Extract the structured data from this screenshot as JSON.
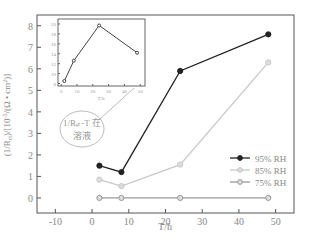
{
  "chart_data": {
    "type": "line",
    "title": "",
    "xlabel": "T/h",
    "ylabel": "(1/R_ct)/[10^-5/(Ω·cm²)]",
    "xlim": [
      -15,
      55
    ],
    "ylim": [
      -0.7,
      8.5
    ],
    "xticks": [
      -10,
      0,
      10,
      20,
      30,
      40,
      50
    ],
    "yticks": [
      0,
      1,
      2,
      3,
      4,
      5,
      6,
      7,
      8
    ],
    "x": [
      2,
      8,
      24,
      48
    ],
    "series": [
      {
        "name": "95% RH",
        "values": [
          1.5,
          1.2,
          5.9,
          7.6
        ],
        "color": "#222222"
      },
      {
        "name": "85% RH",
        "values": [
          0.85,
          0.55,
          1.55,
          6.3
        ],
        "color": "#c8c8c8"
      },
      {
        "name": "75% RH",
        "values": [
          0,
          0,
          0,
          0
        ],
        "color": "#9a9a9a"
      }
    ],
    "legend_position": "lower right",
    "annotation": "1/R_ct-T 在溶液",
    "inset": {
      "type": "line",
      "xlabel": "T/h",
      "ylabel": "(1/R_ct)/[10^-5/(Ω·cm²)]",
      "xticks": [
        0,
        10,
        20,
        30,
        40,
        50
      ],
      "yticks": [
        8,
        10,
        12,
        14,
        16,
        18,
        20
      ],
      "x": [
        2,
        8,
        24,
        48
      ],
      "values": [
        8.5,
        12.6,
        19.7,
        14.2
      ]
    }
  }
}
